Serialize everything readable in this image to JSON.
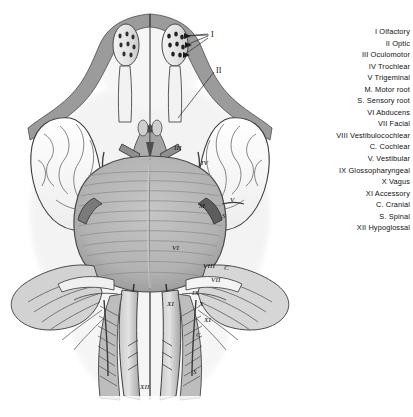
{
  "legend": {
    "items": [
      {
        "text": "I Olfactory",
        "indent": false
      },
      {
        "text": "II Optic",
        "indent": false
      },
      {
        "text": "III Oculomotor",
        "indent": false
      },
      {
        "text": "IV Trochlear",
        "indent": false
      },
      {
        "text": "V Trigeminal",
        "indent": false
      },
      {
        "text": "M. Motor root",
        "indent": true
      },
      {
        "text": "S. Sensory root",
        "indent": true
      },
      {
        "text": "VI Abducens",
        "indent": false
      },
      {
        "text": "VII Facial",
        "indent": false
      },
      {
        "text": "VIII Vestibulocochlear",
        "indent": false
      },
      {
        "text": "C. Cochlear",
        "indent": true
      },
      {
        "text": "V. Vestibular",
        "indent": true
      },
      {
        "text": "IX Glossopharyngeal",
        "indent": false
      },
      {
        "text": "X Vagus",
        "indent": false
      },
      {
        "text": "XI Accessory",
        "indent": false
      },
      {
        "text": "C. Cranial",
        "indent": true
      },
      {
        "text": "S. Spinal",
        "indent": true
      },
      {
        "text": "XII Hypoglossal",
        "indent": false
      }
    ]
  },
  "figure": {
    "labels": [
      {
        "text": "I",
        "x": 211,
        "y": 30,
        "big": true
      },
      {
        "text": "II",
        "x": 216,
        "y": 66,
        "big": true
      },
      {
        "text": "III",
        "x": 174,
        "y": 144,
        "big": false
      },
      {
        "text": "IV",
        "x": 201,
        "y": 159,
        "big": false
      },
      {
        "text": "M",
        "x": 199,
        "y": 202,
        "big": false
      },
      {
        "text": "V",
        "x": 230,
        "y": 196,
        "big": false
      },
      {
        "text": "S",
        "x": 222,
        "y": 212,
        "big": false
      },
      {
        "text": "VI",
        "x": 172,
        "y": 244,
        "big": false
      },
      {
        "text": "VIII",
        "x": 203,
        "y": 262,
        "big": false
      },
      {
        "text": "C",
        "x": 224,
        "y": 264,
        "big": false
      },
      {
        "text": "VII",
        "x": 211,
        "y": 276,
        "big": false
      },
      {
        "text": "IX",
        "x": 192,
        "y": 289,
        "big": false
      },
      {
        "text": "XI",
        "x": 167,
        "y": 300,
        "big": false
      },
      {
        "text": "X",
        "x": 199,
        "y": 300,
        "big": false
      },
      {
        "text": "XI",
        "x": 204,
        "y": 316,
        "big": false
      },
      {
        "text": "C",
        "x": 196,
        "y": 331,
        "big": false
      },
      {
        "text": "S",
        "x": 193,
        "y": 368,
        "big": false
      },
      {
        "text": "XII",
        "x": 140,
        "y": 383,
        "big": false
      }
    ],
    "colors": {
      "background": "#ffffff",
      "brainstem_grey": "#b5b5b5",
      "cortex_white": "#fbfbfb",
      "outline": "#3a3a3a",
      "shadow_grey": "#8d8d8d",
      "dark_grey": "#6a6a6a"
    },
    "caption": "Ventral view of the brain showing the cranial nerves"
  }
}
